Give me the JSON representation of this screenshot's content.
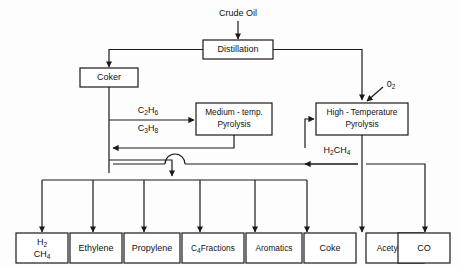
{
  "diagram": {
    "colors": {
      "line": "#1a1a1a",
      "box_fill": "#ffffff",
      "background": "#fdfdfd"
    },
    "feed": {
      "label": "Crude Oil"
    },
    "processes": {
      "distillation": "Distillation",
      "coker": "Coker",
      "medium_pyrolysis_line1": "Medium - temp.",
      "medium_pyrolysis_line2": "Pyrolysis",
      "high_pyrolysis_line1": "High - Temperature",
      "high_pyrolysis_line2": "Pyrolysis"
    },
    "stream_labels": {
      "ethane": {
        "text": "C",
        "sub1": "2",
        "mid": "H",
        "sub2": "6"
      },
      "propane": {
        "text": "C",
        "sub1": "3",
        "mid": "H",
        "sub2": "8"
      },
      "oxygen": {
        "text": "0",
        "sub": "2"
      },
      "hydrogen_methane": {
        "h": "H",
        "h_sub": "2",
        "c": "CH",
        "c_sub": "4"
      }
    },
    "products": [
      {
        "id": "h2-ch4",
        "line1": "H",
        "line1_sub": "2",
        "line2": "CH",
        "line2_sub": "4"
      },
      {
        "id": "ethylene",
        "label": "Ethylene"
      },
      {
        "id": "propylene",
        "label": "Propylene"
      },
      {
        "id": "c4-fractions",
        "label": "C",
        "sub": "4",
        "label2": "Fractions"
      },
      {
        "id": "aromatics",
        "label": "Aromatics"
      },
      {
        "id": "coke",
        "label": "Coke"
      },
      {
        "id": "acetylene",
        "label": "Acetylene"
      },
      {
        "id": "co",
        "label": "CO"
      }
    ]
  }
}
